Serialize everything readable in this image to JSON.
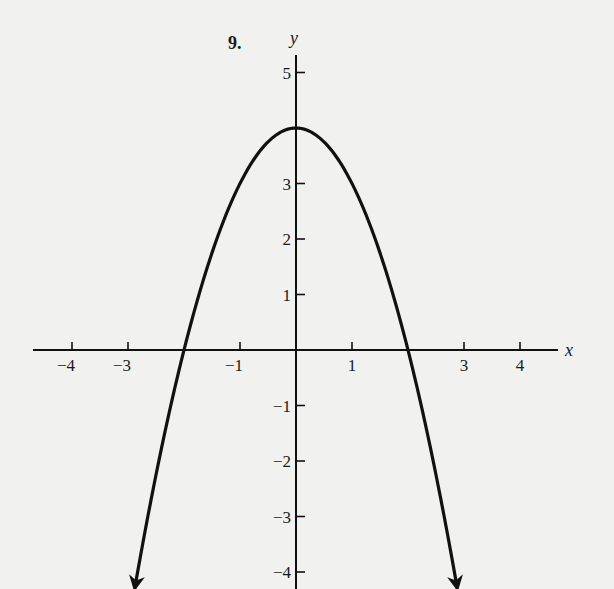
{
  "problem": {
    "number_label": "9."
  },
  "chart_data": {
    "type": "line",
    "title": "",
    "function": "y = 4 - x^2",
    "xlabel": "x",
    "ylabel": "y",
    "xlim": [
      -5.3,
      4.6
    ],
    "ylim": [
      -4.3,
      5.5
    ],
    "grid": false,
    "legend": null,
    "x_ticks": [
      -4,
      -3,
      -1,
      1,
      3,
      4
    ],
    "x_tick_labels": [
      "−4",
      "−3",
      "−1",
      "1",
      "3",
      "4"
    ],
    "y_ticks": [
      5,
      3,
      2,
      1,
      -1,
      -2,
      -3,
      -4
    ],
    "y_tick_labels": [
      "5",
      "3",
      "2",
      "1",
      "−1",
      "−2",
      "−3",
      "−4"
    ],
    "series": [
      {
        "name": "parabola",
        "x": [
          -2.88,
          -2.5,
          -2,
          -1.5,
          -1,
          -0.5,
          0,
          0.5,
          1,
          1.5,
          2,
          2.5,
          2.88
        ],
        "y": [
          -4.29,
          -2.25,
          0,
          1.75,
          3,
          3.75,
          4,
          3.75,
          3,
          1.75,
          0,
          -2.25,
          -4.29
        ],
        "arrows": "both-ends-downward"
      }
    ],
    "annotations": {
      "vertex": [
        0,
        4
      ],
      "x_intercepts": [
        -2,
        2
      ]
    }
  },
  "colors": {
    "background": "#f1f1f0",
    "ink": "#111111"
  }
}
